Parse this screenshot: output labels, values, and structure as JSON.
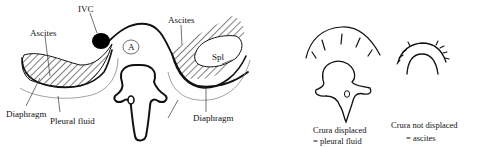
{
  "diagram": {
    "left_figure": {
      "labels": {
        "ivc": "IVC",
        "ascites_left": "Ascites",
        "ascites_right": "Ascites",
        "aorta": "A",
        "spleen": "Spl",
        "diaphragm_left": "Diaphragm",
        "pleural_fluid_left": "Pleural fluid",
        "pleural_fluid_right": "Pl fluid",
        "diaphragm_right": "Diaphragm"
      }
    },
    "right_figures": [
      {
        "caption_line1": "Crura displaced",
        "caption_line2": "= pleural fluid"
      },
      {
        "caption_line1": "Crura not displaced",
        "caption_line2": "= ascites"
      }
    ],
    "colors": {
      "ink": "#111111",
      "background": "#ffffff",
      "ivc_fill": "#000000"
    }
  }
}
